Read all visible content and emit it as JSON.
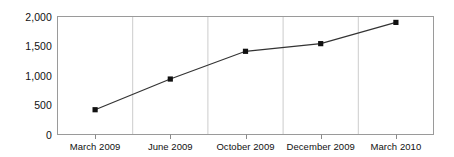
{
  "chart_data": {
    "type": "line",
    "title": "",
    "subtitle": "",
    "xlabel": "",
    "ylabel": "",
    "categories": [
      "March 2009",
      "June 2009",
      "October 2009",
      "December 2009",
      "March 2010"
    ],
    "values": [
      420,
      940,
      1410,
      1540,
      1900
    ],
    "series": [
      {
        "name": "",
        "values": [
          420,
          940,
          1410,
          1540,
          1900
        ]
      }
    ],
    "ylim": [
      0,
      2000
    ],
    "ytick_labels": [
      "2,000",
      "1,500",
      "1,000",
      "500",
      "0"
    ],
    "ytick_values": [
      2000,
      1500,
      1000,
      500,
      0
    ],
    "grid": "vertical",
    "legend": "none",
    "marker": "square",
    "colors": {
      "line": "#333333",
      "marker": "#111111",
      "axis": "#808080",
      "gridline": "#cccccc",
      "text": "#111111",
      "background": "#ffffff"
    }
  },
  "axis": {
    "y_labels": [
      {
        "text": "2,000",
        "value": 2000
      },
      {
        "text": "1,500",
        "value": 1500
      },
      {
        "text": "1,000",
        "value": 1000
      },
      {
        "text": "500",
        "value": 500
      },
      {
        "text": "0",
        "value": 0
      }
    ],
    "x_labels": [
      {
        "text": "March 2009"
      },
      {
        "text": "June 2009"
      },
      {
        "text": "October 2009"
      },
      {
        "text": "December 2009"
      },
      {
        "text": "March 2010"
      }
    ]
  }
}
